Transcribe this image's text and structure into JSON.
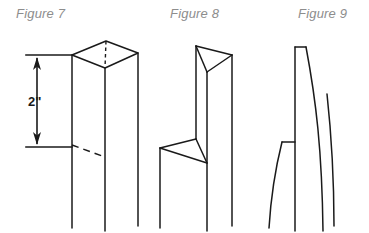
{
  "sheet": {
    "title": "Post shaping sequence",
    "background_color": "#ffffff",
    "line_color": "#1a1a1a",
    "caption_color": "#8d8d8d"
  },
  "figures": [
    {
      "id": "figure-7",
      "caption": "Figure 7",
      "description": "Square post in isometric view with flat top cap, a dashed layout line marking the taper start",
      "dimension": {
        "label": "2\"",
        "name": "taper-start-dimension",
        "value": 2,
        "unit": "inch",
        "style": "double-arrow-vertical"
      }
    },
    {
      "id": "figure-8",
      "caption": "Figure 8",
      "description": "Post with top faceted to a point and a chamfered notch cut at the 2-inch line"
    },
    {
      "id": "figure-9",
      "caption": "Figure 9",
      "description": "Finished post with a smooth curved taper from the 2-inch line up to the pointed tip"
    }
  ]
}
